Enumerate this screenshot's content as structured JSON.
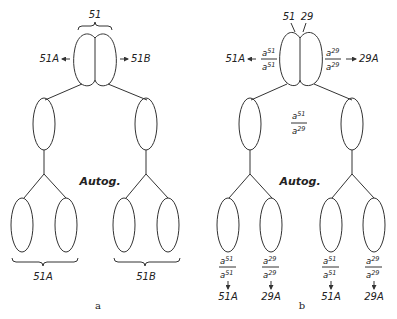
{
  "panel_a": {
    "label": "a",
    "parent_label": "51",
    "left_arrow_label": "51A",
    "right_arrow_label": "51B",
    "center_label": "Autog.",
    "bottom_left_label": "51A",
    "bottom_right_label": "51B"
  },
  "panel_b": {
    "label": "b",
    "parent_left_label": "51",
    "parent_right_label": "29",
    "left_arrow_label": "51A",
    "right_arrow_label": "29A",
    "left_genotype": {
      "top": "a",
      "top_sup": "51",
      "bottom": "a",
      "bottom_sup": "51"
    },
    "right_genotype": {
      "top": "a",
      "top_sup": "29",
      "bottom": "a",
      "bottom_sup": "29"
    },
    "center_genotype": {
      "top": "a",
      "top_sup": "51",
      "bottom": "a",
      "bottom_sup": "29"
    },
    "center_label": "Autog.",
    "offspring": [
      {
        "top": "a",
        "top_sup": "51",
        "bottom": "a",
        "bottom_sup": "51",
        "result": "51A"
      },
      {
        "top": "a",
        "top_sup": "29",
        "bottom": "a",
        "bottom_sup": "29",
        "result": "29A"
      },
      {
        "top": "a",
        "top_sup": "51",
        "bottom": "a",
        "bottom_sup": "51",
        "result": "51A"
      },
      {
        "top": "a",
        "top_sup": "29",
        "bottom": "a",
        "bottom_sup": "29",
        "result": "29A"
      }
    ]
  }
}
